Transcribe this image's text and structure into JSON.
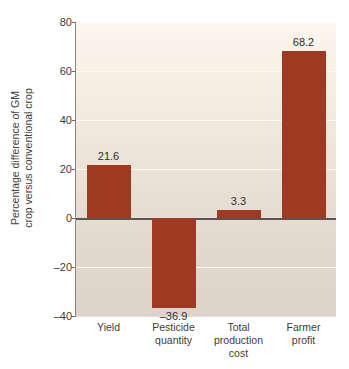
{
  "chart_data": {
    "type": "bar",
    "title": "",
    "xlabel": "",
    "ylabel": "Percentage difference of GM crop versus conventional crop",
    "ylabel_line1": "Percentage difference of GM",
    "ylabel_line2": "crop versus conventional crop",
    "categories": [
      "Yield",
      "Pesticide quantity",
      "Total production cost",
      "Farmer profit"
    ],
    "category_lines": [
      [
        "Yield"
      ],
      [
        "Pesticide",
        "quantity"
      ],
      [
        "Total",
        "production",
        "cost"
      ],
      [
        "Farmer",
        "profit"
      ]
    ],
    "values": [
      21.6,
      -36.9,
      3.3,
      68.2
    ],
    "value_labels": [
      "21.6",
      "–36.9",
      "3.3",
      "68.2"
    ],
    "ylim": [
      -40,
      80
    ],
    "yticks": [
      80,
      60,
      40,
      20,
      0,
      -20,
      -40
    ],
    "ytick_labels": [
      "80",
      "60",
      "40",
      "20",
      "0",
      "–20",
      "–40"
    ],
    "grid": true,
    "legend": null,
    "bar_color": "#9e3a22",
    "plot_background_top": "#fbf7ef",
    "plot_background_bottom": "#dcd3ca",
    "zero_line_color": "#5a5550",
    "gridline_color": "#ffffff",
    "text_color": "#3d3d3d"
  }
}
